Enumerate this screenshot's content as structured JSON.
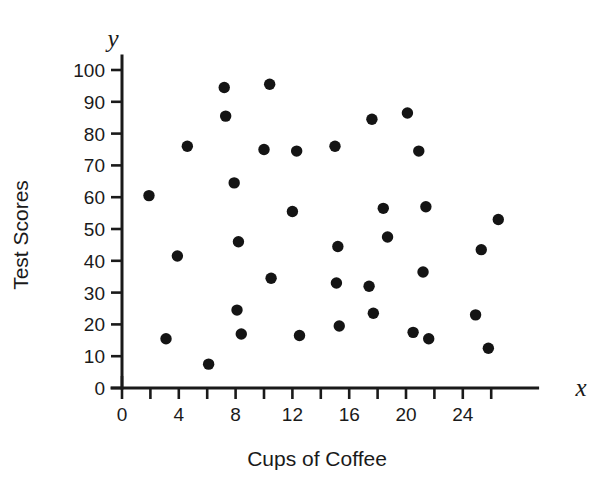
{
  "chart_data": {
    "type": "scatter",
    "title": "",
    "xlabel": "Cups of Coffee",
    "ylabel": "Test Scores",
    "x_var_label": "x",
    "y_var_label": "y",
    "xlim": [
      0,
      28
    ],
    "ylim": [
      0,
      100
    ],
    "grid": false,
    "legend": null,
    "x_ticks": [
      0,
      2,
      4,
      6,
      8,
      10,
      12,
      14,
      16,
      18,
      20,
      22,
      24,
      26
    ],
    "x_tick_labels": [
      "0",
      "",
      "4",
      "",
      "8",
      "",
      "12",
      "",
      "16",
      "",
      "20",
      "",
      "24",
      ""
    ],
    "y_ticks": [
      0,
      10,
      20,
      30,
      40,
      50,
      60,
      70,
      80,
      90,
      100
    ],
    "y_tick_labels": [
      "0",
      "10",
      "20",
      "30",
      "40",
      "50",
      "60",
      "70",
      "80",
      "90",
      "100"
    ],
    "marker": "filled-circle",
    "marker_color": "#141414",
    "marker_size": 7,
    "points": [
      {
        "x": 1.9,
        "y": 60.5
      },
      {
        "x": 3.1,
        "y": 15.5
      },
      {
        "x": 4.6,
        "y": 76.0
      },
      {
        "x": 3.9,
        "y": 41.5
      },
      {
        "x": 6.1,
        "y": 7.5
      },
      {
        "x": 7.2,
        "y": 94.5
      },
      {
        "x": 7.3,
        "y": 85.5
      },
      {
        "x": 7.9,
        "y": 64.5
      },
      {
        "x": 8.2,
        "y": 46.0
      },
      {
        "x": 8.1,
        "y": 24.5
      },
      {
        "x": 8.4,
        "y": 17.0
      },
      {
        "x": 10.4,
        "y": 95.5
      },
      {
        "x": 10.0,
        "y": 75.0
      },
      {
        "x": 10.5,
        "y": 34.5
      },
      {
        "x": 12.3,
        "y": 74.5
      },
      {
        "x": 12.0,
        "y": 55.5
      },
      {
        "x": 12.5,
        "y": 16.5
      },
      {
        "x": 15.0,
        "y": 76.0
      },
      {
        "x": 15.2,
        "y": 44.5
      },
      {
        "x": 15.1,
        "y": 33.0
      },
      {
        "x": 15.3,
        "y": 19.5
      },
      {
        "x": 17.6,
        "y": 84.5
      },
      {
        "x": 17.4,
        "y": 32.0
      },
      {
        "x": 17.7,
        "y": 23.5
      },
      {
        "x": 18.4,
        "y": 56.5
      },
      {
        "x": 18.7,
        "y": 47.5
      },
      {
        "x": 20.1,
        "y": 86.5
      },
      {
        "x": 20.9,
        "y": 74.5
      },
      {
        "x": 21.4,
        "y": 57.0
      },
      {
        "x": 21.2,
        "y": 36.5
      },
      {
        "x": 20.5,
        "y": 17.5
      },
      {
        "x": 21.6,
        "y": 15.5
      },
      {
        "x": 24.9,
        "y": 23.0
      },
      {
        "x": 25.3,
        "y": 43.5
      },
      {
        "x": 26.5,
        "y": 53.0
      },
      {
        "x": 25.8,
        "y": 12.5
      }
    ]
  }
}
